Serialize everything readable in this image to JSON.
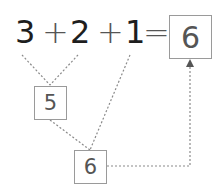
{
  "equation": {
    "terms": [
      "3",
      "2",
      "1"
    ],
    "operators": [
      "+",
      "+"
    ],
    "equals": "=",
    "answer": "6"
  },
  "intermediate": {
    "first_sum": "5",
    "second_sum": "6"
  },
  "colors": {
    "text": "#1e1e1e",
    "box_border": "#9a9a9a",
    "box_text": "#555555",
    "dotted_line": "#8a8a8a"
  }
}
